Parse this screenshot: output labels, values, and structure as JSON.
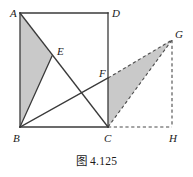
{
  "figure": {
    "caption": "图 4.125",
    "caption_label": "figure-caption",
    "colors": {
      "stroke": "#3a3a3a",
      "shade": "#c9c9c9",
      "dashed": "#4a4a4a",
      "background": "#ffffff",
      "text": "#1a1a1a"
    },
    "points": {
      "A": {
        "label": "A",
        "x": 20,
        "y": 13,
        "label_x": 10,
        "label_y": 11
      },
      "B": {
        "label": "B",
        "x": 20,
        "y": 127,
        "label_x": 13,
        "label_y": 140
      },
      "C": {
        "label": "C",
        "x": 108,
        "y": 127,
        "label_x": 104,
        "label_y": 140
      },
      "D": {
        "label": "D",
        "x": 108,
        "y": 13,
        "label_x": 112,
        "label_y": 11
      },
      "E": {
        "label": "E",
        "x": 52,
        "y": 56,
        "label_x": 57,
        "label_y": 52
      },
      "F": {
        "label": "F",
        "x": 108,
        "y": 78,
        "label_x": 99,
        "label_y": 74
      },
      "G": {
        "label": "G",
        "x": 172,
        "y": 40,
        "label_x": 175,
        "label_y": 36
      },
      "H": {
        "label": "H",
        "x": 172,
        "y": 127,
        "label_x": 169,
        "label_y": 140
      }
    },
    "shaded_regions": [
      {
        "name": "triangle-ABE",
        "vertices": "A,B,E",
        "path": "M 20,13 L 52,56 L 20,127 Z"
      },
      {
        "name": "triangle-CFG",
        "vertices": "C,F,G",
        "path": "M 108,78 L 172,40 L 108,127 Z"
      }
    ],
    "solid_segments": [
      {
        "name": "segment-AD",
        "from": "A",
        "to": "D",
        "path": "M 20,13 L 108,13"
      },
      {
        "name": "segment-AB",
        "from": "A",
        "to": "B",
        "path": "M 20,13 L 20,127"
      },
      {
        "name": "segment-BC",
        "from": "B",
        "to": "C",
        "path": "M 20,127 L 108,127"
      },
      {
        "name": "segment-DC",
        "from": "D",
        "to": "C",
        "path": "M 108,13 L 108,127"
      },
      {
        "name": "segment-AC",
        "from": "A",
        "to": "C",
        "path": "M 20,13 L 108,127"
      },
      {
        "name": "segment-BE",
        "from": "B",
        "to": "E",
        "path": "M 20,127 L 52,56"
      },
      {
        "name": "segment-BF",
        "from": "B",
        "to": "F",
        "path": "M 20,127 L 108,78"
      }
    ],
    "dashed_segments": [
      {
        "name": "segment-FG",
        "from": "F",
        "to": "G",
        "path": "M 108,78 L 172,40"
      },
      {
        "name": "segment-CG",
        "from": "C",
        "to": "G",
        "path": "M 108,127 L 172,40"
      },
      {
        "name": "segment-CH",
        "from": "C",
        "to": "H",
        "path": "M 108,127 L 172,127"
      },
      {
        "name": "segment-GH",
        "from": "G",
        "to": "H",
        "path": "M 172,40 L 172,127"
      }
    ]
  }
}
